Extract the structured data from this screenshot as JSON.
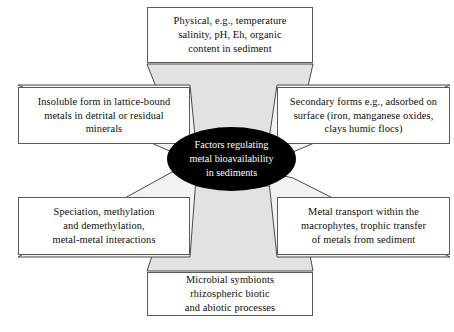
{
  "diagram": {
    "title_hub": "Factors regulating\nmetal bioavailability\nin sediments",
    "hub_fill": "#000000",
    "hub_text_color": "#ffffff",
    "spoke_fill": "#e2e2e2",
    "spoke_stroke": "#4a4a4a",
    "node_fill": "#ffffff",
    "node_stroke": "#5a5a5a",
    "nodes": [
      {
        "id": "top",
        "position": "top",
        "text": "Physical, e.g., temperature\nsalinity, pH, Eh, organic\ncontent in sediment"
      },
      {
        "id": "left-upper",
        "position": "left-upper",
        "text": "Insoluble form in lattice-bound\nmetals in detrital or residual\nminerals"
      },
      {
        "id": "right-upper",
        "position": "right-upper",
        "text": "Secondary forms e.g., adsorbed on\nsurface (iron, manganese oxides,\nclays humic flocs)"
      },
      {
        "id": "left-lower",
        "position": "left-lower",
        "text": "Speciation, methylation\nand demethylation,\nmetal-metal interactions"
      },
      {
        "id": "right-lower",
        "position": "right-lower",
        "text": "Metal transport within the\nmacrophytes, trophic transfer\nof metals from sediment"
      },
      {
        "id": "bottom",
        "position": "bottom",
        "text": "Microbial symbionts\nrhizospheric biotic\nand abiotic processes"
      }
    ]
  }
}
